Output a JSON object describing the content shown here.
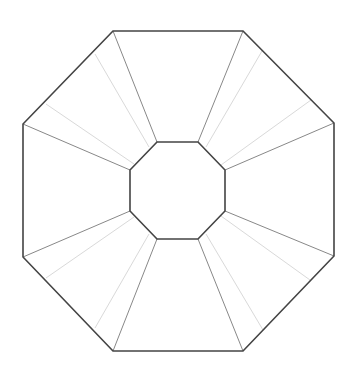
{
  "diagram": {
    "type": "geometric-figure",
    "colors": {
      "background": "#ffffff",
      "outline": "#444444",
      "connector": "#888888",
      "faint": "#d9d9d9"
    },
    "outer_octagon": [
      [
        113,
        31
      ],
      [
        243,
        31
      ],
      [
        334,
        123
      ],
      [
        334,
        256
      ],
      [
        243,
        351
      ],
      [
        113,
        351
      ],
      [
        23,
        257
      ],
      [
        23,
        124
      ]
    ],
    "inner_octagon": [
      [
        157,
        142
      ],
      [
        198,
        142
      ],
      [
        225,
        170
      ],
      [
        225,
        211
      ],
      [
        198,
        239
      ],
      [
        157,
        239
      ],
      [
        130,
        211
      ],
      [
        130,
        170
      ]
    ],
    "connectors": [
      [
        [
          113,
          31
        ],
        [
          157,
          142
        ]
      ],
      [
        [
          243,
          31
        ],
        [
          198,
          142
        ]
      ],
      [
        [
          334,
          123
        ],
        [
          225,
          170
        ]
      ],
      [
        [
          334,
          256
        ],
        [
          225,
          211
        ]
      ],
      [
        [
          243,
          351
        ],
        [
          198,
          239
        ]
      ],
      [
        [
          113,
          351
        ],
        [
          157,
          239
        ]
      ],
      [
        [
          23,
          257
        ],
        [
          130,
          211
        ]
      ],
      [
        [
          23,
          124
        ],
        [
          130,
          170
        ]
      ]
    ],
    "faint_lines": [
      [
        [
          95,
          54
        ],
        [
          149,
          147
        ]
      ],
      [
        [
          46,
          104
        ],
        [
          134,
          164
        ]
      ],
      [
        [
          262,
          51
        ],
        [
          206,
          147
        ]
      ],
      [
        [
          311,
          100
        ],
        [
          221,
          165
        ]
      ],
      [
        [
          310,
          280
        ],
        [
          221,
          216
        ]
      ],
      [
        [
          263,
          330
        ],
        [
          206,
          234
        ]
      ],
      [
        [
          95,
          328
        ],
        [
          149,
          234
        ]
      ],
      [
        [
          46,
          278
        ],
        [
          134,
          217
        ]
      ]
    ]
  }
}
